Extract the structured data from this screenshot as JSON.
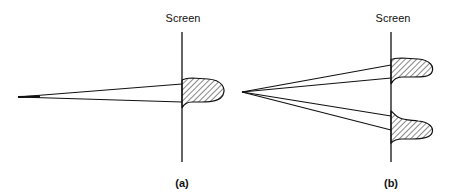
{
  "figure": {
    "panels": [
      {
        "id": "a",
        "caption": "(a)",
        "screen_label": "Screen",
        "description": "Single narrow beam from a point source striking the screen, producing one hatched intensity lobe"
      },
      {
        "id": "b",
        "caption": "(b)",
        "screen_label": "Screen",
        "description": "Two narrow beams diverging from a point source striking the screen, producing two hatched intensity lobes"
      }
    ],
    "colors": {
      "line": "#111111",
      "background": "#ffffff"
    }
  }
}
